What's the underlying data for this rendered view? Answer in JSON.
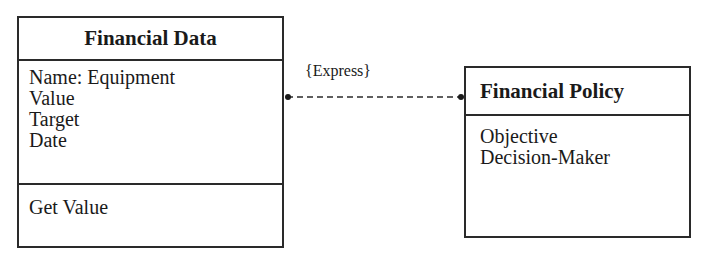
{
  "diagram": {
    "type": "UML class diagram",
    "classes": [
      {
        "name": "Financial Data",
        "attributes": [
          "Name: Equipment",
          "Value",
          "Target",
          "Date"
        ],
        "operations": [
          "Get Value"
        ]
      },
      {
        "name": "Financial Policy",
        "attributes": [
          "Objective",
          "Decision-Maker"
        ],
        "operations": []
      }
    ],
    "association": {
      "label": "{Express}",
      "style": "dashed",
      "from": "Financial Data",
      "to": "Financial Policy",
      "end_markers": [
        "dot",
        "dot"
      ]
    },
    "colors": {
      "line": "#2a2a2a",
      "text": "#1a1a1a",
      "background": "#ffffff"
    }
  }
}
